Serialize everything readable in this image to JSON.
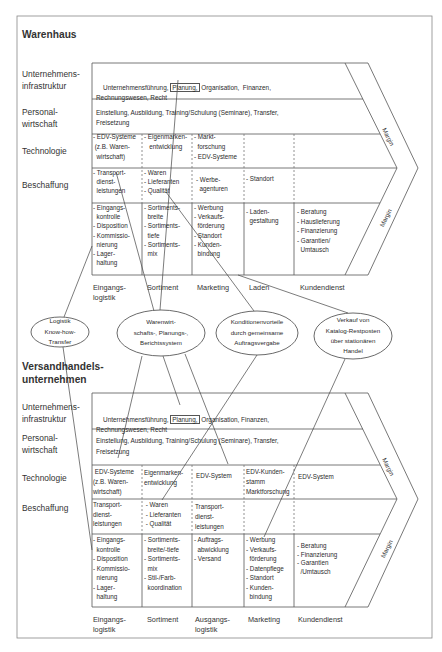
{
  "warenhaus": {
    "title": "Warenhaus",
    "row_labels": {
      "infrastruktur": "Unternehmens-\ninfrastruktur",
      "personal": "Personal-\nwirtschaft",
      "technologie": "Technologie",
      "beschaffung": "Beschaffung"
    },
    "infrastruktur": {
      "pre": "Unternehmensführung, ",
      "boxed": "Planung,",
      "post": " Organisation,  Finanzen,",
      "line2": "Rechnungswesen, Recht"
    },
    "personal": "Einstellung, Ausbildung, Training/Schulung (Seminare), Transfer,\nFreisetzung",
    "technologie": [
      "- EDV-Systeme\n (z.B. Waren-\n  wirtschaft)",
      "- Eigenmarken-\n   entwicklung",
      "- Markt-\n  forschung\n- EDV-Systeme",
      "",
      ""
    ],
    "beschaffung": [
      "- Transport-\n  dienst-\n  leistungen",
      "- Waren\n- Lieferanten\n- Qualität",
      "- Werbe-\n  agenturen",
      "- Standort",
      ""
    ],
    "primaer": [
      "- Eingangs-\n  kontrolle\n- Disposition\n- Kommissio-\n  nierung\n- Lager-\n  haltung",
      "- Sortiments-\n  breite\n- Sortiments-\n  tiefe\n- Sortiments-\n  mix",
      "- Werbung\n- Verkaufs-\n  förderung\n- Standort\n- Kunden-\n  bindung",
      "- Laden-\n  gestaltung",
      "- Beratung\n- Hauslieferung\n- Finanzierung\n- Garantien/\n  Umtausch"
    ],
    "columns": [
      "Eingangs-\nlogistik",
      "Sortiment",
      "Marketing",
      "Laden",
      "Kundendienst"
    ],
    "margin_labels": [
      "Margin",
      "Margin"
    ]
  },
  "synergien": [
    "Logistik\nKnow-how-\nTransfer",
    "Warenwirt-\nschafts-, Planungs-,\nBerichtssystem",
    "Konditionenvorteile\ndurch gemeinsame\nAuftragsvergabe",
    "Verkauf von\nKatalog-Restposten\nüber stationären\nHandel"
  ],
  "versandhandel": {
    "title": "Versandhandels-\nunternehmen",
    "row_labels": {
      "infrastruktur": "Unternehmens-\ninfrastruktur",
      "personal": "Personal-\nwirtschaft",
      "technologie": "Technologie",
      "beschaffung": "Beschaffung"
    },
    "infrastruktur": {
      "pre": "Unternehmensführung, ",
      "boxed": "Planung,",
      "post": " Organisation, Finanzen,",
      "line2": "Rechnungswesen, Recht"
    },
    "personal": "Einstellung, Ausbildung, Training/Schulung (Seminare), Transfer,\nFreisetzung",
    "technologie": [
      " EDV-Systeme\n(z.B. Waren-\nwirtschaft)",
      "Eigenmarken-\nentwicklung",
      "EDV-System",
      "EDV-Kunden-\nstamm\nMarktforschung",
      "EDV-System"
    ],
    "beschaffung": [
      "Transport-\ndienst-\nleistungen",
      " - Waren\n - Lieferanten\n - Qualität",
      "Transport-\ndienst-\nleistungen",
      "",
      ""
    ],
    "primaer": [
      "- Eingangs-\n  kontrolle\n- Disposition\n- Kommissio-\n  nierung\n- Lager-\n  haltung",
      "- Sortiments-\n  breite/-tiefe\n- Sortiments-\n  mix\n- Stil-/Farb-\n  koordination",
      "- Auftrags-\n  abwicklung\n- Versand",
      "- Werbung\n- Verkaufs-\n  förderung\n- Datenpflege\n- Standort\n- Kunden-\n  bindung",
      "- Beratung\n- Finanzierung\n- Garantien\n  /Umtausch"
    ],
    "columns": [
      "Eingangs-\nlogistik",
      "Sortiment",
      "Ausgangs-\nlogistik",
      "Marketing",
      "Kundendienst"
    ],
    "margin_labels": [
      "Margin",
      "Margin"
    ]
  }
}
